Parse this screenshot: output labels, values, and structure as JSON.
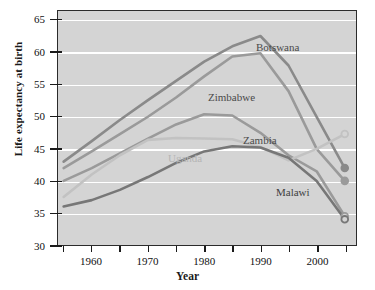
{
  "chart_data": {
    "type": "line",
    "title": "",
    "xlabel": "Year",
    "ylabel": "Life expectancy at birth",
    "xlim": [
      1954,
      2007
    ],
    "ylim": [
      30,
      66.5
    ],
    "yticks": [
      30,
      35,
      40,
      45,
      50,
      55,
      60,
      65
    ],
    "xticks_major": [
      1960,
      1970,
      1980,
      1990,
      2000
    ],
    "xticks_minor": [
      1955,
      1965,
      1975,
      1985,
      1995,
      2005
    ],
    "grid": "horizontal-white",
    "legend": "inline-labels",
    "plot_background": "#d4d4d4",
    "series": [
      {
        "name": "Botswana",
        "color": "#8a8a8a",
        "label_color": "#4a4a4a",
        "end_marker": "filled-circle",
        "x": [
          1955,
          1960,
          1965,
          1970,
          1975,
          1980,
          1985,
          1990,
          1995,
          2000,
          2005
        ],
        "values": [
          43.0,
          46.2,
          49.5,
          52.6,
          55.6,
          58.6,
          61.0,
          62.6,
          58.0,
          50.0,
          42.0
        ]
      },
      {
        "name": "Zimbabwe",
        "color": "#9a9a9a",
        "label_color": "#4a4a4a",
        "end_marker": "filled-circle",
        "x": [
          1955,
          1960,
          1965,
          1970,
          1975,
          1980,
          1985,
          1990,
          1995,
          2000,
          2005
        ],
        "values": [
          42.0,
          44.6,
          47.3,
          50.0,
          53.0,
          56.3,
          59.4,
          59.9,
          54.0,
          45.0,
          40.0
        ]
      },
      {
        "name": "Zambia",
        "color": "#9a9a9a",
        "label_color": "#4a4a4a",
        "end_marker": "open-circle",
        "x": [
          1955,
          1960,
          1965,
          1970,
          1975,
          1980,
          1985,
          1990,
          1995,
          2000,
          2005
        ],
        "values": [
          40.0,
          42.0,
          44.3,
          46.6,
          48.8,
          50.4,
          50.2,
          47.5,
          44.0,
          41.5,
          34.5
        ]
      },
      {
        "name": "Uganda",
        "color": "#c2c2c2",
        "label_color": "#b5b5b5",
        "end_marker": "open-circle",
        "x": [
          1955,
          1960,
          1965,
          1970,
          1975,
          1980,
          1985,
          1990,
          1995,
          2000,
          2005
        ],
        "values": [
          37.5,
          41.0,
          44.0,
          46.4,
          46.7,
          46.6,
          46.5,
          45.3,
          43.2,
          45.0,
          47.3
        ]
      },
      {
        "name": "Malawi",
        "color": "#777777",
        "label_color": "#3f3f3f",
        "end_marker": "open-circle",
        "x": [
          1955,
          1960,
          1965,
          1970,
          1975,
          1980,
          1985,
          1990,
          1995,
          2000,
          2005
        ],
        "values": [
          36.0,
          37.0,
          38.6,
          40.6,
          42.8,
          44.6,
          45.4,
          45.2,
          43.6,
          40.0,
          34.0
        ]
      }
    ],
    "series_label_positions": [
      {
        "name": "Botswana",
        "x": 256,
        "y": 41
      },
      {
        "name": "Zimbabwe",
        "x": 208,
        "y": 91
      },
      {
        "name": "Zambia",
        "x": 243,
        "y": 134
      },
      {
        "name": "Uganda",
        "x": 168,
        "y": 152
      },
      {
        "name": "Malawi",
        "x": 276,
        "y": 186
      }
    ]
  }
}
